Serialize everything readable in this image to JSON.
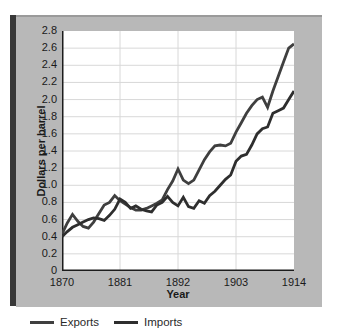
{
  "colors": {
    "page_bg": "#ffffff",
    "panel_bg": "#b8b8b8",
    "panel_edge_bar": "#383838",
    "panel_top_edge": "#9a9a9a",
    "plot_bg": "#ffffff",
    "grid": "#d8d8d8",
    "axis": "#1c1c1c",
    "text": "#1a1a1a"
  },
  "chart_data": {
    "type": "line",
    "title": "",
    "xlabel": "Year",
    "ylabel": "Dollars per barrel",
    "xlim": [
      1870,
      1914
    ],
    "ylim": [
      0,
      2.8
    ],
    "x_ticks": [
      1870,
      1881,
      1892,
      1903,
      1914
    ],
    "y_ticks": [
      0,
      0.2,
      0.4,
      0.6,
      0.8,
      1.0,
      1.2,
      1.4,
      1.6,
      1.8,
      2.0,
      2.2,
      2.4,
      2.6,
      2.8
    ],
    "y_tick_labels": [
      "0",
      "0.2",
      "0.4",
      "0.6",
      "0.8",
      "1.0",
      "1.2",
      "1.4",
      "1.6",
      "1.8",
      "2.0",
      "2.2",
      "2.4",
      "2.6",
      "2.8"
    ],
    "grid": true,
    "legend_position": "below-left",
    "x": [
      1870,
      1871,
      1872,
      1873,
      1874,
      1875,
      1876,
      1877,
      1878,
      1879,
      1880,
      1881,
      1882,
      1883,
      1884,
      1885,
      1886,
      1887,
      1888,
      1889,
      1890,
      1891,
      1892,
      1893,
      1894,
      1895,
      1896,
      1897,
      1898,
      1899,
      1900,
      1901,
      1902,
      1903,
      1904,
      1905,
      1906,
      1907,
      1908,
      1909,
      1910,
      1911,
      1912,
      1913,
      1914
    ],
    "series": [
      {
        "name": "Exports",
        "color": "#3f3f3f",
        "values": [
          0.43,
          0.56,
          0.66,
          0.58,
          0.52,
          0.5,
          0.57,
          0.67,
          0.77,
          0.8,
          0.88,
          0.82,
          0.78,
          0.74,
          0.71,
          0.71,
          0.73,
          0.76,
          0.79,
          0.83,
          0.95,
          1.05,
          1.19,
          1.06,
          1.02,
          1.06,
          1.18,
          1.3,
          1.39,
          1.46,
          1.47,
          1.46,
          1.49,
          1.62,
          1.73,
          1.84,
          1.93,
          2.0,
          2.03,
          1.91,
          2.1,
          2.27,
          2.44,
          2.6,
          2.65
        ]
      },
      {
        "name": "Imports",
        "color": "#2e2e2e",
        "values": [
          0.4,
          0.46,
          0.51,
          0.54,
          0.57,
          0.6,
          0.62,
          0.61,
          0.59,
          0.65,
          0.72,
          0.84,
          0.8,
          0.73,
          0.76,
          0.72,
          0.7,
          0.69,
          0.77,
          0.8,
          0.87,
          0.8,
          0.76,
          0.86,
          0.75,
          0.73,
          0.82,
          0.79,
          0.88,
          0.93,
          1.0,
          1.07,
          1.12,
          1.28,
          1.34,
          1.36,
          1.47,
          1.6,
          1.66,
          1.68,
          1.84,
          1.87,
          1.9,
          2.0,
          2.1
        ]
      }
    ]
  }
}
